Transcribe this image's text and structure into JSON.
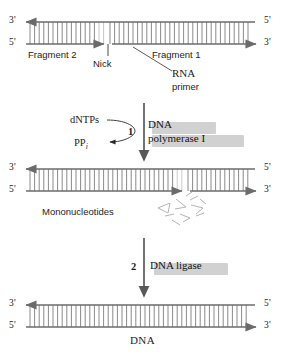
{
  "diagram": {
    "colors": {
      "strand": "#6b6b6b",
      "rung": "#7d7d7d",
      "text": "#1d1d1d",
      "shadow": "#c9c9c9",
      "leader": "#4a4a4a"
    }
  },
  "duplex1": {
    "left_top_label": "3'",
    "left_bottom_label": "5'",
    "right_top_label": "5'",
    "right_bottom_label": "3'",
    "fragment_left": "Fragment 2",
    "fragment_right": "Fragment 1",
    "nick_label": "Nick",
    "primer_line1": "RNA",
    "primer_line2": "primer"
  },
  "step1": {
    "number": "1",
    "substrate": "dNTPs",
    "product_main": "PP",
    "product_sub": "i",
    "enzyme_line1": "DNA",
    "enzyme_line2": "polymerase I"
  },
  "duplex2": {
    "left_top_label": "3'",
    "left_bottom_label": "5'",
    "right_top_label": "5'",
    "right_bottom_label": "3'",
    "mononucleotides_label": "Mononucleotides"
  },
  "step2": {
    "number": "2",
    "enzyme": "DNA ligase"
  },
  "duplex3": {
    "left_top_label": "3'",
    "left_bottom_label": "5'",
    "right_top_label": "5'",
    "right_bottom_label": "3'",
    "product_label": "DNA"
  }
}
